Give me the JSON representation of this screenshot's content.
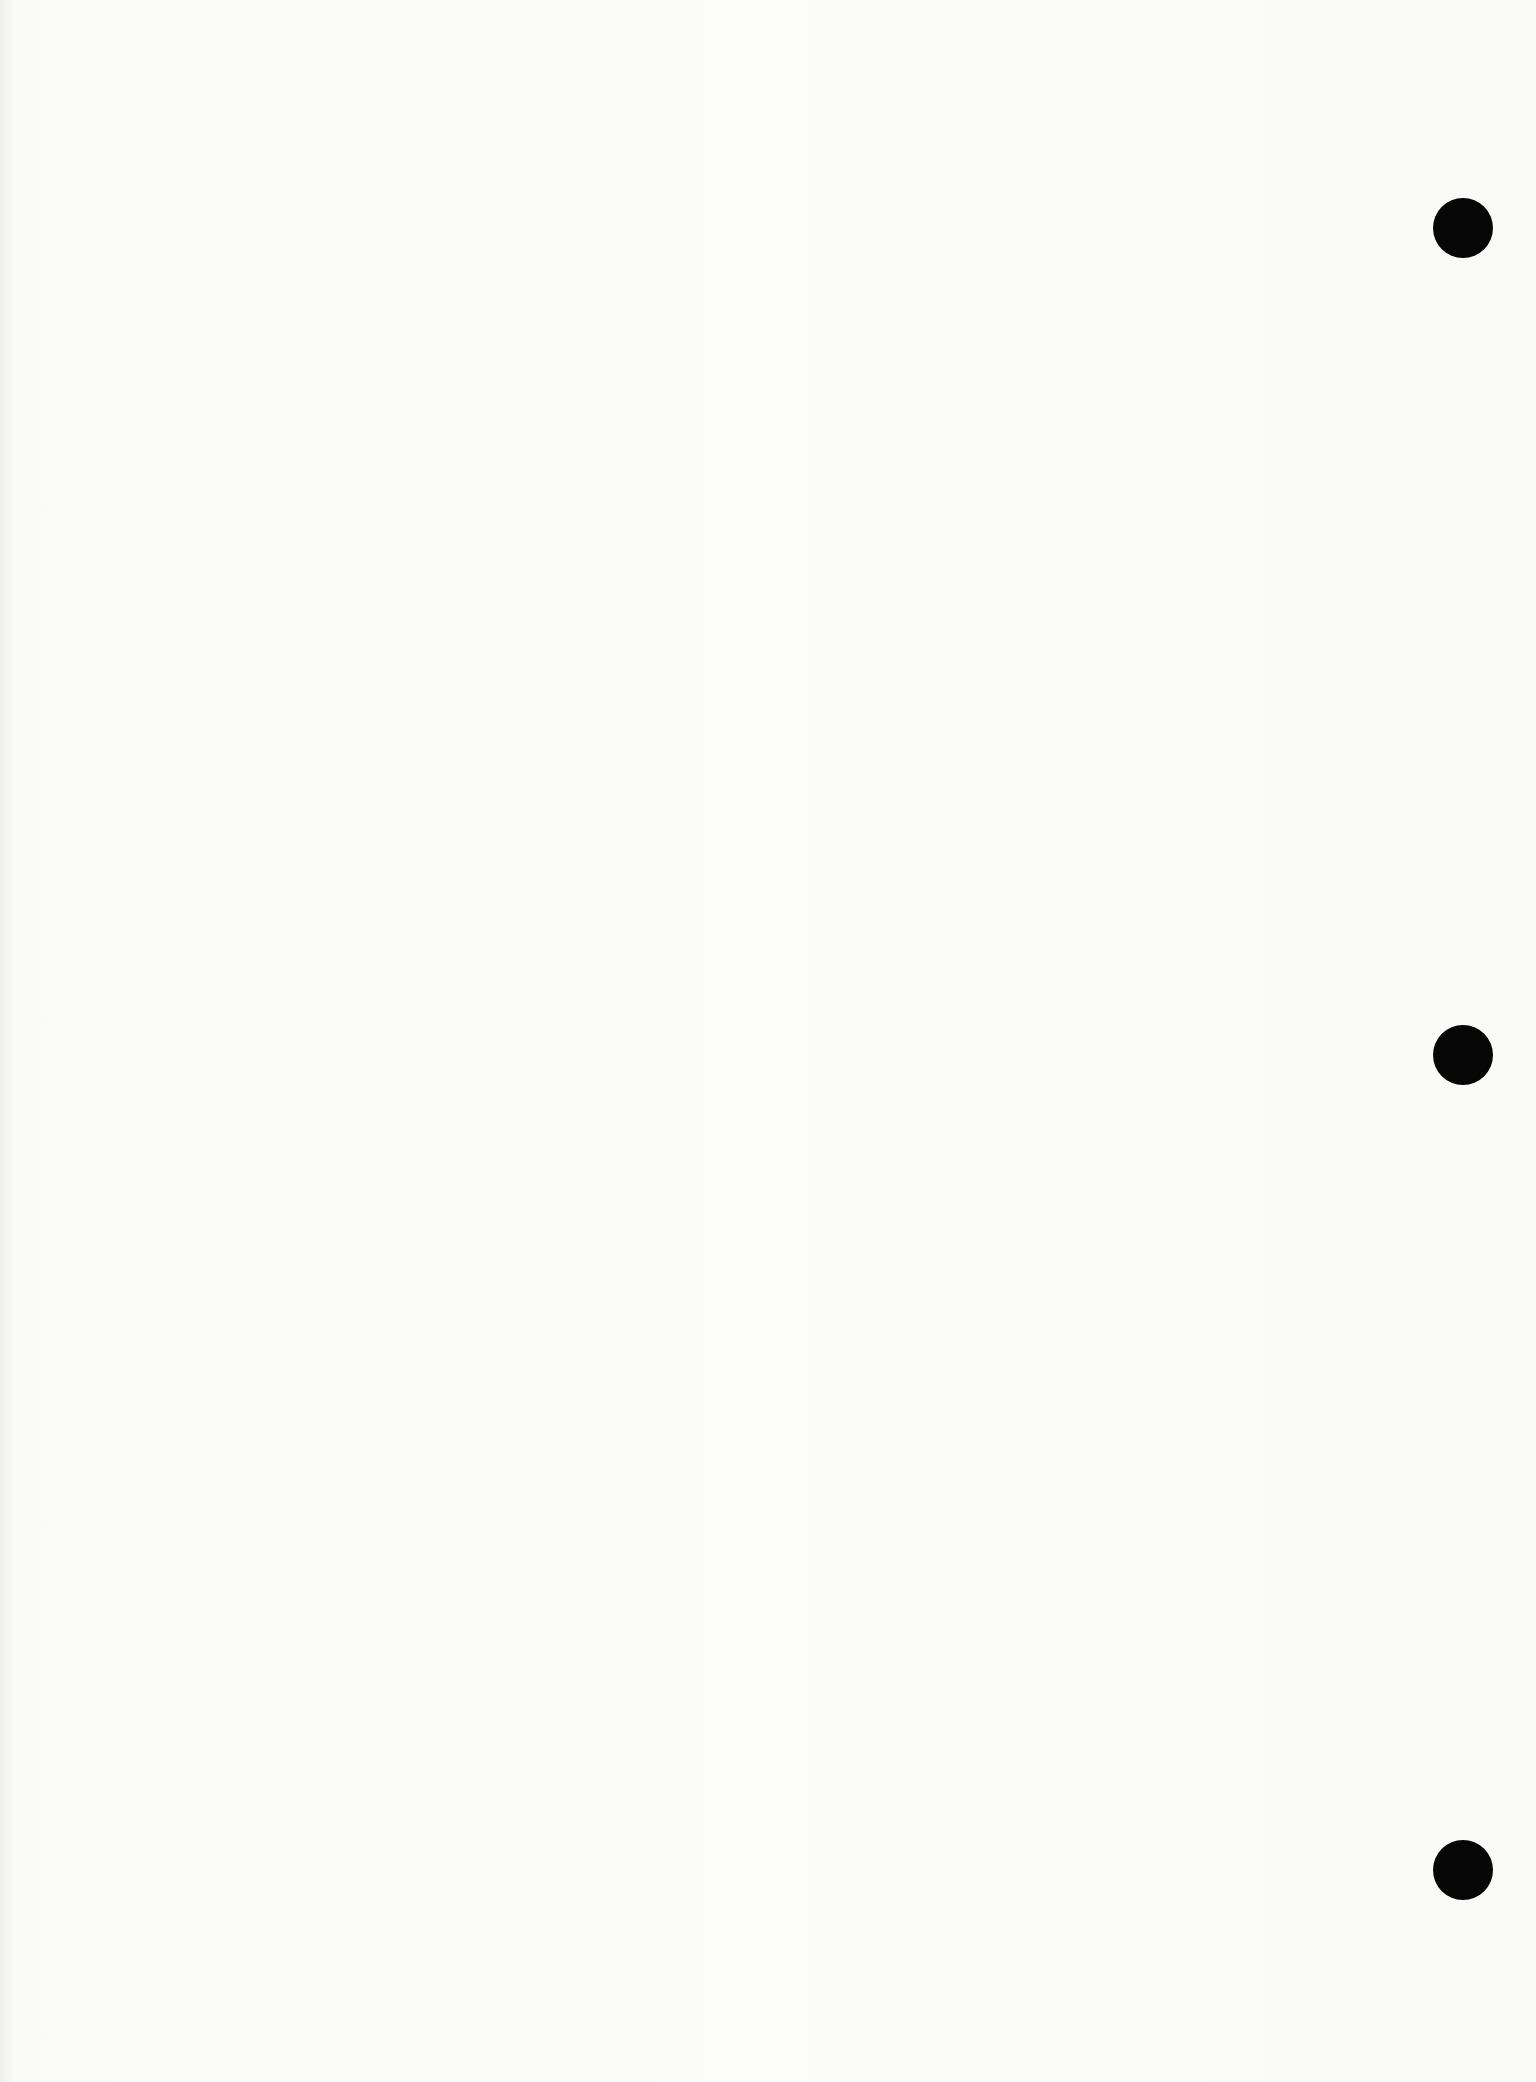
{
  "page": {
    "type": "blank scanned page",
    "text": ""
  },
  "punch_holes": [
    {
      "x": 1463,
      "y": 228
    },
    {
      "x": 1463,
      "y": 1055
    },
    {
      "x": 1463,
      "y": 1870
    }
  ],
  "colors": {
    "paper": "#fcfcfb",
    "hole": "#060606"
  }
}
